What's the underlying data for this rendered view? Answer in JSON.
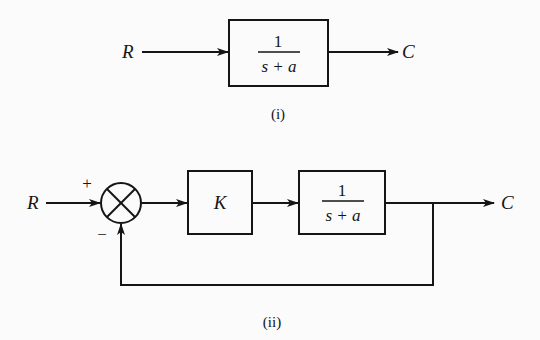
{
  "diagram_i": {
    "caption": "(i)",
    "input_label": "R",
    "output_label": "C",
    "block": {
      "numerator": "1",
      "denominator": "s + a"
    }
  },
  "diagram_ii": {
    "caption": "(ii)",
    "input_label": "R",
    "output_label": "C",
    "summing_junction": {
      "plus_sign": "+",
      "minus_sign": "−"
    },
    "gain_block": {
      "label": "K"
    },
    "plant_block": {
      "numerator": "1",
      "denominator": "s + a"
    },
    "feedback": "unity negative feedback"
  },
  "colors": {
    "line": "#151515",
    "background": "#fbfbfb"
  }
}
